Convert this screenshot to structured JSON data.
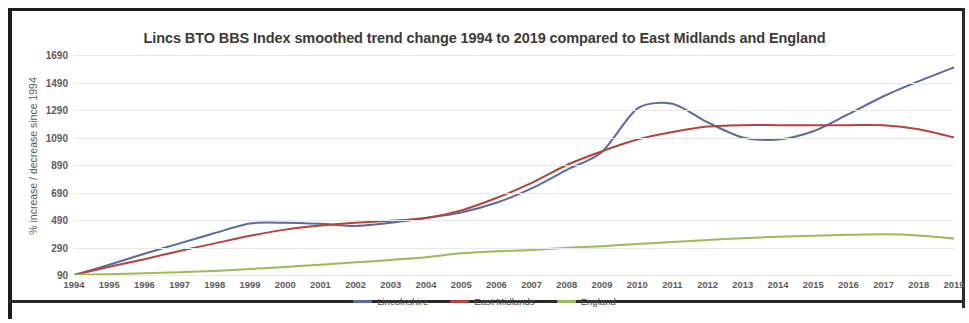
{
  "chart_data": {
    "type": "line",
    "title": "Lincs BTO BBS Index smoothed trend change 1994 to 2019 compared to East Midlands and England",
    "xlabel": "",
    "ylabel": "% increase / decrease since 1994",
    "x": [
      1994,
      1995,
      1996,
      1997,
      1998,
      1999,
      2000,
      2001,
      2002,
      2003,
      2004,
      2005,
      2006,
      2007,
      2008,
      2009,
      2010,
      2011,
      2012,
      2013,
      2014,
      2015,
      2016,
      2017,
      2018,
      2019
    ],
    "xtick_labels": [
      "1994",
      "1995",
      "1996",
      "1997",
      "1998",
      "1999",
      "2000",
      "2001",
      "2002",
      "2003",
      "2004",
      "2005",
      "2006",
      "2007",
      "2008",
      "2009",
      "2010",
      "2011",
      "2012",
      "2013",
      "2014",
      "2015",
      "2016",
      "2017",
      "2018",
      "2019"
    ],
    "ytick_labels": [
      "1690",
      "1490",
      "1290",
      "1090",
      "890",
      "690",
      "490",
      "290",
      "90"
    ],
    "yticks": [
      1690,
      1490,
      1290,
      1090,
      890,
      690,
      490,
      290,
      90
    ],
    "ylim": [
      90,
      1690
    ],
    "xlim": [
      1994,
      2019
    ],
    "grid": true,
    "legend_position": "bottom-center",
    "series": [
      {
        "name": "Lincolnshire",
        "color": "#5b6b9e",
        "values": [
          90,
          165,
          245,
          320,
          395,
          465,
          470,
          462,
          447,
          470,
          505,
          545,
          615,
          720,
          855,
          985,
          1300,
          1335,
          1200,
          1090,
          1075,
          1135,
          1260,
          1390,
          1500,
          1600
        ]
      },
      {
        "name": "East Midlands",
        "color": "#b4443a",
        "values": [
          90,
          150,
          205,
          265,
          320,
          375,
          420,
          450,
          470,
          485,
          505,
          560,
          650,
          760,
          890,
          990,
          1075,
          1130,
          1170,
          1180,
          1180,
          1180,
          1180,
          1180,
          1150,
          1090
        ]
      },
      {
        "name": "England",
        "color": "#9bbb59",
        "values": [
          90,
          96,
          102,
          110,
          120,
          133,
          148,
          165,
          182,
          200,
          220,
          248,
          262,
          272,
          288,
          300,
          315,
          330,
          345,
          358,
          368,
          376,
          382,
          386,
          378,
          355
        ]
      }
    ]
  },
  "legend": {
    "items": [
      {
        "label": "Lincolnshire",
        "color": "#5b6b9e"
      },
      {
        "label": "East Midlands",
        "color": "#b4443a"
      },
      {
        "label": "England",
        "color": "#9bbb59"
      }
    ]
  }
}
